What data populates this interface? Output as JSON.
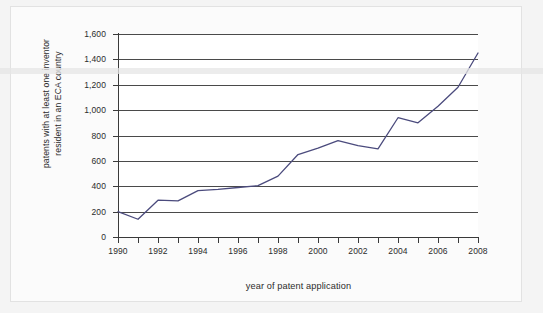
{
  "chart_data": {
    "type": "line",
    "title": "",
    "subtitle": "",
    "xlabel": "year of patent application",
    "ylabel": "patents with at least one inventor resident in an ECA country",
    "ylabel_lines": [
      "patents with at least one inventor",
      "resident in an ECA country"
    ],
    "x": [
      1990,
      1991,
      1992,
      1993,
      1994,
      1995,
      1996,
      1997,
      1998,
      1999,
      2000,
      2001,
      2002,
      2003,
      2004,
      2005,
      2006,
      2007,
      2008
    ],
    "values": [
      200,
      140,
      290,
      285,
      365,
      375,
      390,
      405,
      480,
      650,
      700,
      760,
      720,
      695,
      940,
      900,
      1030,
      1180,
      1450
    ],
    "series": [
      {
        "name": "patents with at least one inventor resident in an ECA country",
        "color": "#4b4b7d",
        "values": [
          200,
          140,
          290,
          285,
          365,
          375,
          390,
          405,
          480,
          650,
          700,
          760,
          720,
          695,
          940,
          900,
          1030,
          1180,
          1450
        ]
      }
    ],
    "xlim": [
      1990,
      2008
    ],
    "ylim": [
      0,
      1600
    ],
    "y_ticks": [
      0,
      200,
      400,
      600,
      800,
      1000,
      1200,
      1400,
      1600
    ],
    "y_tick_labels": [
      "0",
      "200",
      "400",
      "600",
      "800",
      "1,000",
      "1,200",
      "1,400",
      "1,600"
    ],
    "x_ticks": [
      1990,
      1991,
      1992,
      1993,
      1994,
      1995,
      1996,
      1997,
      1998,
      1999,
      2000,
      2001,
      2002,
      2003,
      2004,
      2005,
      2006,
      2007,
      2008
    ],
    "x_tick_labels_shown": [
      "1990",
      "1992",
      "1994",
      "1996",
      "1998",
      "2000",
      "2002",
      "2004",
      "2006",
      "2008"
    ],
    "grid": "horizontal",
    "legend": "none",
    "line_color": "#4b4b7d",
    "grid_color": "#4a4a4a",
    "axis_color": "#3a3a3a",
    "plot_background": "#ffffff",
    "page_background": "#f4f4f4"
  }
}
